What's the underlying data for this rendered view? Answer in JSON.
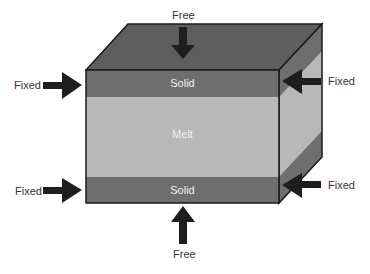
{
  "diagram": {
    "layers": [
      {
        "name": "Solid",
        "position": "top"
      },
      {
        "name": "Melt",
        "position": "middle"
      },
      {
        "name": "Solid",
        "position": "bottom"
      }
    ],
    "boundary_conditions": {
      "top": "Free",
      "bottom": "Free",
      "left_upper": "Fixed",
      "left_lower": "Fixed",
      "right_upper": "Fixed",
      "right_lower": "Fixed"
    },
    "colors": {
      "solid": "#6e6e6e",
      "melt": "#b8b8b8",
      "top_face": "#5e5e5e",
      "arrow": "#1e1e1e",
      "outline": "#1a1a1a"
    }
  }
}
